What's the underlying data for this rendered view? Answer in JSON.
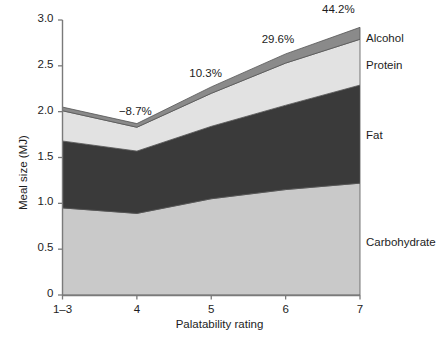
{
  "chart_data": {
    "type": "area",
    "title": "",
    "xlabel": "Palatability rating",
    "ylabel": "Meal size (MJ)",
    "categories": [
      "1–3",
      "4",
      "5",
      "6",
      "7"
    ],
    "x_tick_labels": [
      "1–3",
      "4",
      "5",
      "6",
      "7"
    ],
    "y_tick_labels": [
      "0",
      "0.5",
      "1.0",
      "1.5",
      "2.0",
      "2.5",
      "3.0"
    ],
    "y_tick_values": [
      0,
      0.5,
      1.0,
      1.5,
      2.0,
      2.5,
      3.0
    ],
    "ylim": [
      0,
      3.0
    ],
    "grid": false,
    "legend_position": "right",
    "stacked": true,
    "series": [
      {
        "name": "Carbohydrate",
        "color": "#c9c9c9",
        "values": [
          0.95,
          0.89,
          1.05,
          1.15,
          1.22
        ]
      },
      {
        "name": "Fat",
        "color": "#3a3a3a",
        "values": [
          0.73,
          0.68,
          0.79,
          0.92,
          1.07
        ]
      },
      {
        "name": "Protein",
        "color": "#e2e2e2",
        "values": [
          0.33,
          0.26,
          0.36,
          0.46,
          0.5
        ]
      },
      {
        "name": "Alcohol",
        "color": "#8a8a8a",
        "values": [
          0.04,
          0.04,
          0.07,
          0.1,
          0.13
        ]
      }
    ],
    "totals": [
      2.05,
      1.87,
      2.27,
      2.63,
      2.92
    ],
    "annotations": [
      {
        "text": "−8.7%",
        "x_category": "4",
        "value": -8.7
      },
      {
        "text": "10.3%",
        "x_category": "5",
        "value": 10.3
      },
      {
        "text": "29.6%",
        "x_category": "6",
        "value": 29.6
      },
      {
        "text": "44.2%",
        "x_category": "7",
        "value": 44.2
      }
    ]
  },
  "legend": {
    "items": [
      {
        "label": "Alcohol"
      },
      {
        "label": "Protein"
      },
      {
        "label": "Fat"
      },
      {
        "label": "Carbohydrate"
      }
    ]
  },
  "axes": {
    "y_title": "Meal size (MJ)",
    "x_title": "Palatability rating"
  }
}
